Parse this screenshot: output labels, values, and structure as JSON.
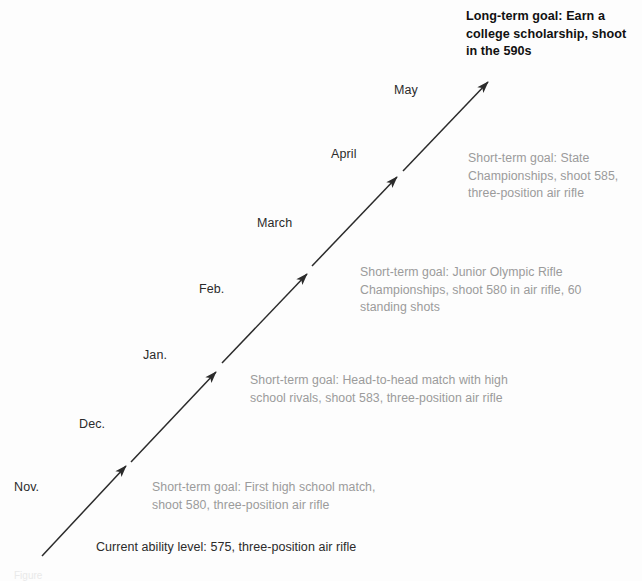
{
  "diagram": {
    "type": "goal-ladder",
    "title_long_term": "Long-term goal: Earn a\ncollege scholarship, shoot\nin the 590s",
    "baseline": "Current ability level: 575, three-position air rifle",
    "caption_partial": "Figure",
    "colors": {
      "arrow": "#2b2b2b",
      "month_text": "#2b2b2b",
      "note_text": "#9b9b9b",
      "goal_text": "#111111",
      "background": "#fdfdfd"
    },
    "months": [
      {
        "label": "Nov.",
        "x": 14,
        "y": 480
      },
      {
        "label": "Dec.",
        "x": 79,
        "y": 417
      },
      {
        "label": "Jan.",
        "x": 143,
        "y": 348
      },
      {
        "label": "Feb.",
        "x": 199,
        "y": 282
      },
      {
        "label": "March",
        "x": 257,
        "y": 216
      },
      {
        "label": "April",
        "x": 331,
        "y": 147
      },
      {
        "label": "May",
        "x": 394,
        "y": 83
      }
    ],
    "steps": [
      {
        "id": "step-1",
        "note": "Short-term goal: First high school match,\nshoot 580, three-position air rifle",
        "note_x": 152,
        "note_y": 479,
        "arrow": {
          "x1": 42,
          "y1": 556,
          "x2": 126,
          "y2": 466
        }
      },
      {
        "id": "step-2",
        "note": "Short-term goal: Head-to-head match with high\nschool rivals, shoot 583, three-position air rifle",
        "note_x": 250,
        "note_y": 372,
        "arrow": {
          "x1": 131,
          "y1": 462,
          "x2": 216,
          "y2": 372
        }
      },
      {
        "id": "step-3",
        "note": "Short-term goal: Junior Olympic Rifle\nChampionships, shoot 580 in air rifle, 60\nstanding shots",
        "note_x": 360,
        "note_y": 264,
        "arrow": {
          "x1": 222,
          "y1": 363,
          "x2": 307,
          "y2": 274
        }
      },
      {
        "id": "step-4",
        "note": "Short-term goal: State\nChampionships, shoot 585,\nthree-position air rifle",
        "note_x": 468,
        "note_y": 150,
        "arrow": {
          "x1": 312,
          "y1": 266,
          "x2": 397,
          "y2": 177
        }
      },
      {
        "id": "step-5",
        "note": "",
        "note_x": 0,
        "note_y": 0,
        "arrow": {
          "x1": 403,
          "y1": 171,
          "x2": 488,
          "y2": 82
        }
      }
    ],
    "baseline_pos": {
      "x": 96,
      "y": 540
    },
    "long_term_pos": {
      "x": 466,
      "y": 8
    },
    "caption_pos": {
      "x": 14,
      "y": 570
    }
  }
}
